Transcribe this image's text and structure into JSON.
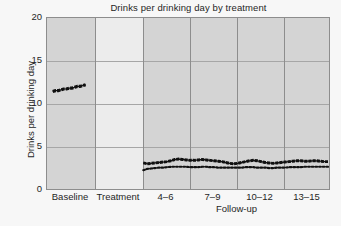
{
  "chart_data": {
    "type": "line",
    "title": "Drinks per drinking day by treatment",
    "xlabel": "Follow-up",
    "ylabel": "Drinks per drinking day",
    "ylim": [
      0,
      20
    ],
    "yticks": [
      0,
      5,
      10,
      15,
      20
    ],
    "ytick_labels": [
      "0",
      "5",
      "10",
      "15",
      "20"
    ],
    "grid": "horizontal-and-panel-separators",
    "legend": "none",
    "panels": [
      {
        "label": "Baseline",
        "shaded": true
      },
      {
        "label": "Treatment",
        "shaded": false
      },
      {
        "label": "4–6",
        "shaded": true
      },
      {
        "label": "7–9",
        "shaded": true
      },
      {
        "label": "10–12",
        "shaded": true
      },
      {
        "label": "13–15",
        "shaded": true
      }
    ],
    "xtick_labels": [
      "Baseline",
      "Treatment",
      "4–6",
      "7–9",
      "10–12",
      "13–15"
    ],
    "series": [
      {
        "name": "upper-series",
        "style": "solid-thick-dark",
        "color": "#111111",
        "baseline_x": [
          0.06,
          0.12,
          0.18,
          0.24,
          0.3,
          0.36,
          0.42,
          0.48,
          0.54,
          0.6,
          0.66,
          0.72,
          0.78
        ],
        "baseline_values": [
          11.4,
          11.5,
          11.5,
          11.6,
          11.7,
          11.7,
          11.8,
          11.8,
          11.9,
          12.0,
          12.0,
          12.1,
          12.2
        ],
        "followup_values": [
          3.05,
          2.95,
          3.0,
          3.05,
          3.1,
          3.15,
          3.2,
          3.3,
          3.45,
          3.5,
          3.45,
          3.4,
          3.35,
          3.35,
          3.4,
          3.45,
          3.4,
          3.35,
          3.3,
          3.25,
          3.2,
          3.1,
          3.0,
          2.95,
          3.0,
          3.1,
          3.2,
          3.3,
          3.35,
          3.3,
          3.2,
          3.1,
          3.05,
          3.0,
          3.05,
          3.1,
          3.15,
          3.2,
          3.25,
          3.3,
          3.3,
          3.25,
          3.25,
          3.3,
          3.3,
          3.25,
          3.2,
          3.2
        ]
      },
      {
        "name": "lower-series",
        "style": "dotted",
        "color": "#111111",
        "followup_values": [
          2.2,
          2.35,
          2.4,
          2.45,
          2.5,
          2.5,
          2.55,
          2.6,
          2.6,
          2.6,
          2.6,
          2.6,
          2.55,
          2.55,
          2.55,
          2.6,
          2.6,
          2.55,
          2.55,
          2.5,
          2.5,
          2.5,
          2.5,
          2.5,
          2.5,
          2.5,
          2.55,
          2.55,
          2.55,
          2.5,
          2.5,
          2.5,
          2.45,
          2.45,
          2.5,
          2.5,
          2.5,
          2.55,
          2.55,
          2.55,
          2.55,
          2.6,
          2.6,
          2.6,
          2.6,
          2.6,
          2.6,
          2.6
        ]
      }
    ]
  },
  "colors": {
    "figure_background": "#f7f7f7",
    "panel_shaded": "#d4d4d4",
    "panel_light": "#ececec",
    "axis_line": "#8d8d8d",
    "gridline": "#a6a6a6",
    "series_line": "#111111",
    "text": "#1f1f1f"
  }
}
